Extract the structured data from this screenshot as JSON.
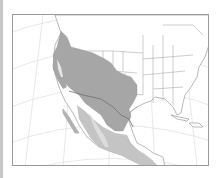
{
  "map": {
    "region": "North America (western US, Mexico, Central America)",
    "projection": "conic",
    "colors": {
      "background": "#ffffff",
      "frame": "#9a9a9a",
      "graticule": "#dcdcdc",
      "borders": "#8a8a8a",
      "range_primary": "#a6a6a6",
      "range_secondary": "#c4c4c4",
      "range_outline": "#6e6e6e"
    },
    "legend": [],
    "labels": []
  }
}
